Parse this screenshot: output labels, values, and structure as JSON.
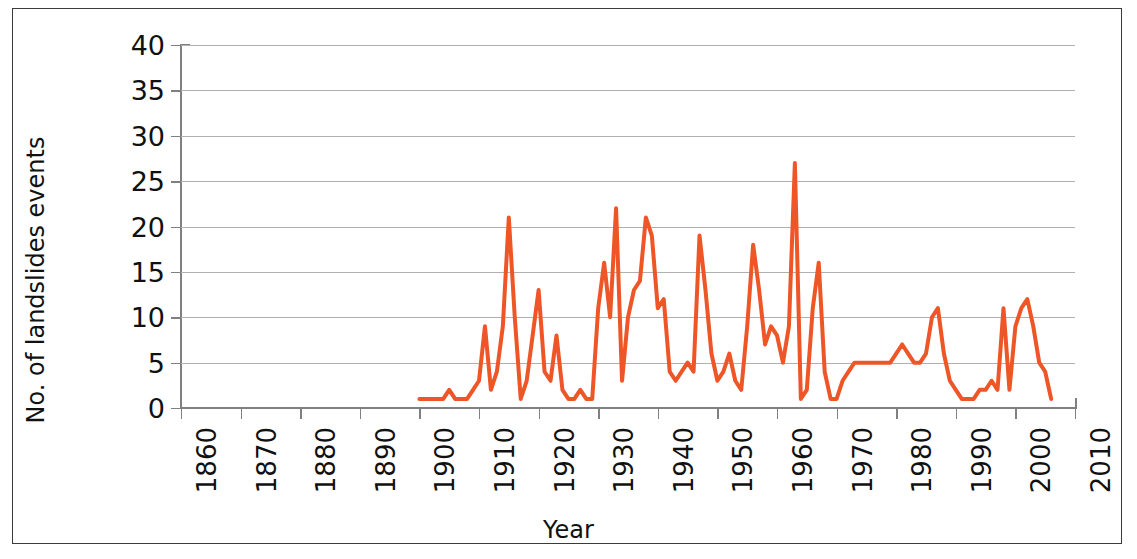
{
  "chart_data": {
    "type": "line",
    "title": "",
    "xlabel": "Year",
    "ylabel": "No. of landslides events",
    "xlim": [
      1860,
      2010
    ],
    "ylim": [
      0,
      40
    ],
    "xticks": [
      1860,
      1870,
      1880,
      1890,
      1900,
      1910,
      1920,
      1930,
      1940,
      1950,
      1960,
      1970,
      1980,
      1990,
      2000,
      2010
    ],
    "yticks": [
      0,
      5,
      10,
      15,
      20,
      25,
      30,
      35,
      40
    ],
    "xtick_labels": [
      "1860",
      "1870",
      "1880",
      "1890",
      "1900",
      "1910",
      "1920",
      "1930",
      "1940",
      "1950",
      "1960",
      "1970",
      "1980",
      "1990",
      "2000",
      "2010"
    ],
    "ytick_labels": [
      "0",
      "5",
      "10",
      "15",
      "20",
      "25",
      "30",
      "35",
      "40"
    ],
    "grid": "horizontal",
    "legend": "none",
    "line_color": "#EE5527",
    "line_width": 4,
    "series": [
      {
        "name": "No. of landslides events",
        "x": [
          1900,
          1901,
          1902,
          1903,
          1904,
          1905,
          1906,
          1907,
          1908,
          1909,
          1910,
          1911,
          1912,
          1913,
          1914,
          1915,
          1916,
          1917,
          1918,
          1919,
          1920,
          1921,
          1922,
          1923,
          1924,
          1925,
          1926,
          1927,
          1928,
          1929,
          1930,
          1931,
          1932,
          1933,
          1934,
          1935,
          1936,
          1937,
          1938,
          1939,
          1940,
          1941,
          1942,
          1943,
          1944,
          1945,
          1946,
          1947,
          1948,
          1949,
          1950,
          1951,
          1952,
          1953,
          1954,
          1955,
          1956,
          1957,
          1958,
          1959,
          1960,
          1961,
          1962,
          1963,
          1964,
          1965,
          1966,
          1967,
          1968,
          1969,
          1970,
          1971,
          1972,
          1973,
          1974,
          1975,
          1976,
          1977,
          1978,
          1979,
          1980,
          1981,
          1982,
          1983,
          1984,
          1985,
          1986,
          1987,
          1988,
          1989,
          1990,
          1991,
          1992,
          1993,
          1994,
          1995,
          1996,
          1997,
          1998,
          1999,
          2000,
          2001,
          2002,
          2003,
          2004,
          2005,
          2006
        ],
        "y": [
          1,
          1,
          1,
          1,
          1,
          2,
          1,
          1,
          1,
          2,
          3,
          9,
          2,
          4,
          9,
          21,
          10,
          1,
          3,
          8,
          13,
          4,
          3,
          8,
          2,
          1,
          1,
          2,
          1,
          1,
          11,
          16,
          10,
          22,
          3,
          10,
          13,
          14,
          21,
          19,
          11,
          12,
          4,
          3,
          4,
          5,
          4,
          19,
          13,
          6,
          3,
          4,
          6,
          3,
          2,
          9,
          18,
          13,
          7,
          9,
          8,
          5,
          9,
          27,
          1,
          2,
          11,
          16,
          4,
          1,
          1,
          3,
          4,
          5,
          5,
          5,
          5,
          5,
          5,
          5,
          6,
          7,
          6,
          5,
          5,
          6,
          10,
          11,
          6,
          3,
          2,
          1,
          1,
          1,
          2,
          2,
          3,
          2,
          11,
          2,
          9,
          11,
          12,
          9,
          5,
          4,
          1
        ]
      }
    ],
    "max_value": 27,
    "max_value_year": 1963,
    "data_start_year": 1900,
    "data_end_year": 2006
  },
  "figure": {
    "background_color": "#FFFFFF",
    "border_color": "#3A3A3A",
    "grid_color": "#B0B0B0",
    "axis_color": "#808080",
    "text_color": "#111111"
  }
}
